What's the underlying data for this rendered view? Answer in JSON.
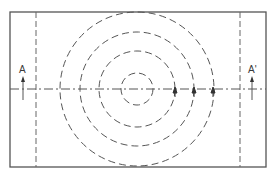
{
  "diagram": {
    "type": "section-view-schematic",
    "frame": {
      "x": 10,
      "y": 12,
      "width": 256,
      "height": 155,
      "stroke": "#555555"
    },
    "vertical_dashed_lines": [
      {
        "x": 36
      },
      {
        "x": 240
      }
    ],
    "center_line": {
      "y": 89,
      "style": "dash-dot"
    },
    "concentric_circles": {
      "center": {
        "x": 137,
        "y": 89
      },
      "radii": [
        16,
        38,
        57,
        77
      ],
      "style": "dashed"
    },
    "arrows_on_center_line": [
      {
        "x": 175
      },
      {
        "x": 194
      },
      {
        "x": 213
      }
    ],
    "section_markers": [
      {
        "label": "A",
        "x": 23,
        "arrow": "up-arrow"
      },
      {
        "label": "A'",
        "x": 252,
        "arrow": "up-arrow"
      }
    ],
    "colors": {
      "line": "#555555",
      "background": "#ffffff"
    }
  }
}
